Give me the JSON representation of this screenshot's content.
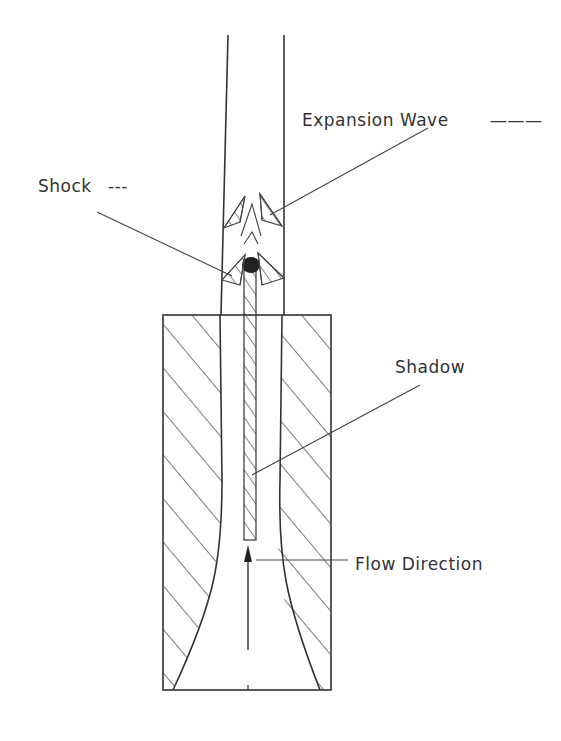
{
  "diagram": {
    "labels": {
      "expansion_wave": "Expansion Wave",
      "expansion_wave_legend": "———",
      "shock": "Shock",
      "shock_legend": "---",
      "shadow": "Shadow",
      "flow_direction": "Flow Direction"
    },
    "colors": {
      "line": "#333333",
      "background": "#ffffff",
      "ball": "#222222"
    }
  }
}
